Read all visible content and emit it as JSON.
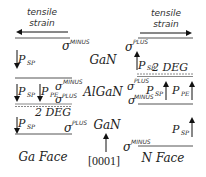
{
  "diagram": {
    "left_panel": {
      "face_label": "Ga Face",
      "strain_label_line1": "tensile",
      "strain_label_line2": "strain",
      "strain_direction": "left",
      "top_layer": {
        "material": "GaN",
        "sigma_top": "MINUS",
        "vectors": [
          {
            "label": "P",
            "sub": "SP",
            "direction": "down"
          }
        ]
      },
      "middle_layer": {
        "material": "AlGaN",
        "sigma_top": "MINUS",
        "sigma_bottom": "PLUS",
        "vectors": [
          {
            "label": "P",
            "sub": "SP",
            "direction": "down"
          },
          {
            "label": "P",
            "sub": "PE",
            "direction": "down"
          }
        ]
      },
      "interface_label": "2 DEG",
      "bottom_layer": {
        "material": "GaN",
        "sigma_bottom": "PLUS",
        "vectors": [
          {
            "label": "P",
            "sub": "SP",
            "direction": "down"
          }
        ]
      }
    },
    "right_panel": {
      "face_label": "N Face",
      "strain_label_line1": "tensile",
      "strain_label_line2": "strain",
      "strain_direction": "right",
      "top_layer": {
        "sigma_top": "PLUS",
        "vectors": [
          {
            "label": "P",
            "sub": "SP",
            "direction": "up"
          }
        ]
      },
      "interface_label": "2 DEG",
      "middle_layer": {
        "sigma_top": "PLUS",
        "sigma_bottom": "MINUS",
        "vectors": [
          {
            "label": "P",
            "sub": "SP",
            "direction": "up"
          },
          {
            "label": "P",
            "sub": "PE",
            "direction": "up"
          }
        ]
      },
      "bottom_layer": {
        "sigma_bottom": "MINUS",
        "vectors": [
          {
            "label": "P",
            "sub": "SP",
            "direction": "up"
          }
        ]
      }
    },
    "center": {
      "top_material": "GaN",
      "middle_material": "AlGaN",
      "bottom_material": "GaN",
      "axis_label": "[0001]",
      "axis_direction": "up"
    },
    "symbols": {
      "sigma": "σ",
      "minus": "MINUS",
      "plus": "PLUS",
      "p": "P",
      "sp": "SP",
      "pe": "PE"
    },
    "colors": {
      "ink": "#222222",
      "line": "#555555",
      "dashed": "#888888"
    }
  }
}
